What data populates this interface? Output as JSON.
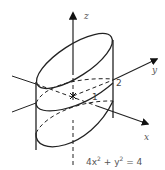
{
  "diagram": {
    "type": "3d-elliptic-cylinder",
    "axes": {
      "z_label": "z",
      "y_label": "y",
      "x_label": "x"
    },
    "intercepts": {
      "y": "2",
      "x": "1"
    },
    "equation": {
      "base": "4x",
      "exp1": "2",
      "mid": " + y",
      "exp2": "2",
      "rhs": " = 4",
      "full": "4x² + y² = 4"
    },
    "colors": {
      "stroke": "#222222",
      "label": "#555555",
      "background": "#ffffff"
    }
  }
}
